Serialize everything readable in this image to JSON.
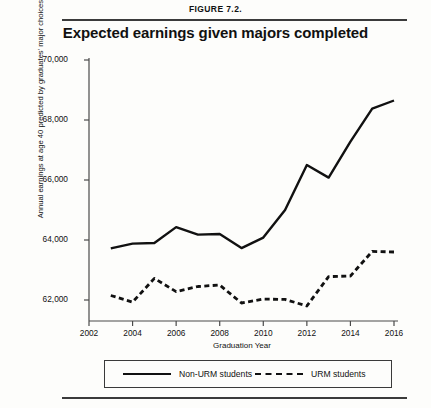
{
  "figure": {
    "label": "FIGURE 7.2.",
    "title": "Expected earnings given majors completed"
  },
  "chart_data": {
    "type": "line",
    "title": "Expected earnings given majors completed",
    "xlabel": "Graduation Year",
    "ylabel": "Annual earnings at age 40 predicted by graduates' major choices (2016$)",
    "x": [
      2003,
      2004,
      2005,
      2006,
      2007,
      2008,
      2009,
      2010,
      2011,
      2012,
      2013,
      2014,
      2015,
      2016
    ],
    "xlim": [
      2002,
      2016
    ],
    "ylim": [
      61000,
      70000
    ],
    "xticks": [
      "2002",
      "2004",
      "2006",
      "2008",
      "2010",
      "2012",
      "2014",
      "2016"
    ],
    "yticks": [
      "62,000",
      "64,000",
      "66,000",
      "68,000",
      "70,000"
    ],
    "grid": false,
    "legend_position": "bottom",
    "series": [
      {
        "name": "Non-URM students",
        "style": "solid",
        "color": "#111111",
        "values": [
          63720,
          63880,
          63900,
          64430,
          64180,
          64200,
          63730,
          64080,
          65000,
          66500,
          66080,
          67280,
          68380,
          68650
        ]
      },
      {
        "name": "URM students",
        "style": "dashed",
        "color": "#111111",
        "values": [
          62150,
          61930,
          62720,
          62280,
          62450,
          62500,
          61900,
          62030,
          62020,
          61800,
          62780,
          62800,
          63620,
          63600
        ]
      }
    ]
  },
  "legend": {
    "items": [
      {
        "label": "Non-URM students",
        "style": "solid"
      },
      {
        "label": "URM students",
        "style": "dashed"
      }
    ]
  }
}
